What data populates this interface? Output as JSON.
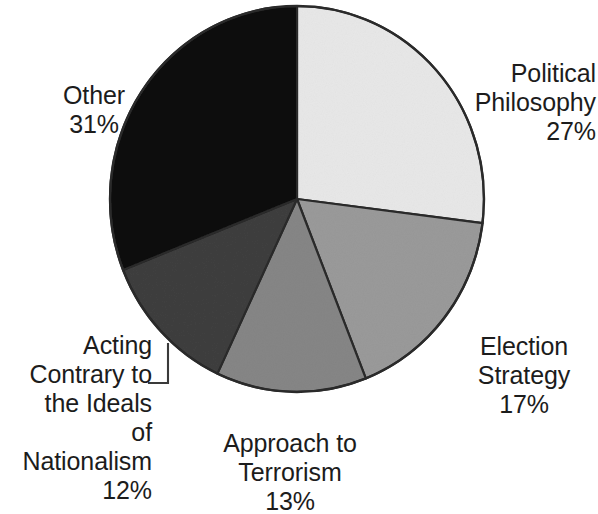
{
  "chart_data": {
    "type": "pie",
    "title": "",
    "subtitle": "",
    "xlabel": "",
    "ylabel": "",
    "legend_position": "none",
    "grid": false,
    "units": "percent",
    "total": 100,
    "start_angle_deg": 0,
    "direction": "clockwise",
    "categories": [
      "Political Philosophy",
      "Election Strategy",
      "Approach to Terrorism",
      "Acting Contrary to the Ideals of Nationalism",
      "Other"
    ],
    "values": [
      27,
      17,
      13,
      12,
      31
    ],
    "colors": [
      "#e8e8e8",
      "#9a9a9a",
      "#868686",
      "#3f3f3f",
      "#0d0d0d"
    ],
    "slices": [
      {
        "name": "Political Philosophy",
        "value": 27,
        "percent_label": "27%",
        "color": "#e8e8e8",
        "label_line1": "Political",
        "label_line2": "Philosophy",
        "has_leader_line": false
      },
      {
        "name": "Election Strategy",
        "value": 17,
        "percent_label": "17%",
        "color": "#9a9a9a",
        "label_line1": "Election",
        "label_line2": "Strategy",
        "has_leader_line": false
      },
      {
        "name": "Approach to Terrorism",
        "value": 13,
        "percent_label": "13%",
        "color": "#868686",
        "label_line1": "Approach to",
        "label_line2": "Terrorism",
        "has_leader_line": false
      },
      {
        "name": "Acting Contrary to the Ideals of Nationalism",
        "value": 12,
        "percent_label": "12%",
        "color": "#3f3f3f",
        "label_line1": "Acting",
        "label_line2": "Contrary to",
        "label_line3": "the Ideals",
        "label_line4": "of Nationalism",
        "has_leader_line": true
      },
      {
        "name": "Other",
        "value": 31,
        "percent_label": "31%",
        "color": "#0d0d0d",
        "label_line1": "Other",
        "has_leader_line": false
      }
    ]
  },
  "labels": {
    "political_philosophy": {
      "text": "Political\nPhilosophy",
      "percent": "27%"
    },
    "election_strategy": {
      "text": "Election\nStrategy",
      "percent": "17%"
    },
    "approach_terrorism": {
      "text": "Approach to\nTerrorism",
      "percent": "13%"
    },
    "acting_contrary": {
      "text": "Acting\nContrary to\nthe Ideals\nof Nationalism",
      "percent": "12%"
    },
    "other": {
      "text": "Other",
      "percent": "31%"
    }
  },
  "style": {
    "background": "#ffffff",
    "text_color": "#1c1c1c",
    "outline_color": "#2a2a2a",
    "leader_line_color": "#3a3a3a"
  }
}
